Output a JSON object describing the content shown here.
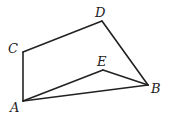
{
  "diagram": {
    "points": {
      "A": {
        "label": "A",
        "x": 23,
        "y": 101,
        "lx": 10,
        "ly": 112
      },
      "B": {
        "label": "B",
        "x": 148,
        "y": 85,
        "lx": 151,
        "ly": 93
      },
      "C": {
        "label": "C",
        "x": 23,
        "y": 52,
        "lx": 8,
        "ly": 53
      },
      "D": {
        "label": "D",
        "x": 102,
        "y": 21,
        "lx": 95,
        "ly": 17
      },
      "E": {
        "label": "E",
        "x": 103,
        "y": 70,
        "lx": 97,
        "ly": 66
      }
    },
    "segments": [
      "AC",
      "CD",
      "DB",
      "BA",
      "AE",
      "EB"
    ],
    "stroke_color": "#222222"
  }
}
